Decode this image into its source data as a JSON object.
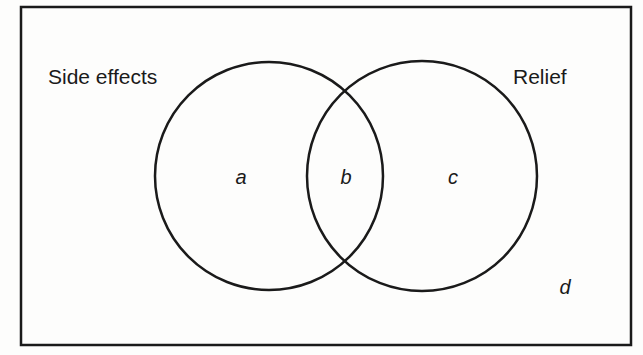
{
  "diagram": {
    "type": "venn",
    "sets": [
      {
        "name": "Side effects",
        "label": "Side effects"
      },
      {
        "name": "Relief",
        "label": "Relief"
      }
    ],
    "regions": [
      {
        "id": "a",
        "label": "a",
        "description": "Side effects only"
      },
      {
        "id": "b",
        "label": "b",
        "description": "Side effects and Relief"
      },
      {
        "id": "c",
        "label": "c",
        "description": "Relief only"
      },
      {
        "id": "d",
        "label": "d",
        "description": "Neither"
      }
    ],
    "colors": {
      "stroke": "#1a1a1a",
      "background": "#fdfdfc"
    }
  }
}
